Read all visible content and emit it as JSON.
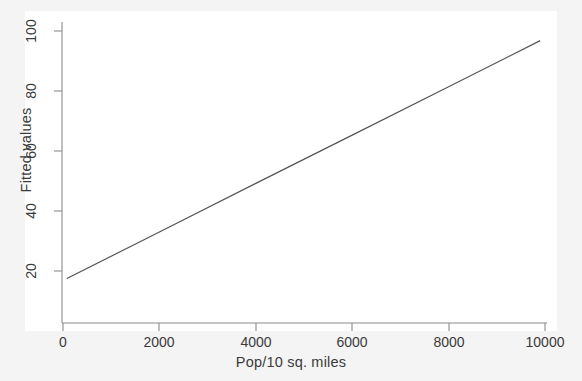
{
  "chart_data": {
    "type": "line",
    "title": "",
    "xlabel": "Pop/10 sq. miles",
    "ylabel": "Fitted values",
    "xlim": [
      -250,
      10400
    ],
    "ylim": [
      14,
      103
    ],
    "xticks": [
      0,
      2000,
      4000,
      6000,
      8000,
      10000
    ],
    "xtick_labels": [
      "0",
      "2000",
      "4000",
      "6000",
      "8000",
      "10000"
    ],
    "yticks": [
      20,
      40,
      60,
      80,
      100
    ],
    "ytick_labels": [
      "20",
      "40",
      "60",
      "80",
      "100"
    ],
    "grid": false,
    "legend": "none",
    "series": [
      {
        "name": "Fitted values",
        "color": "#555555",
        "linewidth": 1.2,
        "x": [
          80,
          9900
        ],
        "y": [
          17.5,
          96.8
        ],
        "points": [
          {
            "x": 80,
            "y": 17.5
          },
          {
            "x": 2000,
            "y": 33.0
          },
          {
            "x": 4000,
            "y": 49.2
          },
          {
            "x": 6000,
            "y": 65.3
          },
          {
            "x": 8000,
            "y": 81.4
          },
          {
            "x": 9900,
            "y": 96.8
          }
        ]
      }
    ],
    "colors": {
      "background": "#f4f4f4",
      "panel": "#ffffff",
      "axis": "#8a8a8a",
      "text": "#3a3a3a",
      "line": "#555555"
    }
  }
}
